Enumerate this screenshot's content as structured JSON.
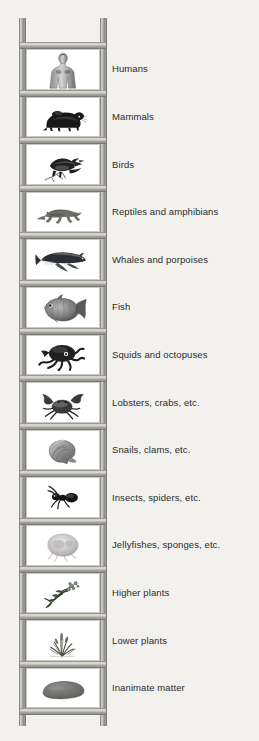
{
  "diagram": {
    "type": "ladder-hierarchy",
    "background_color": "#f2f1ee",
    "rail_color": "#a9a7a2",
    "panel_color": "#ffffff",
    "text_color": "#2b2b2b",
    "rung_count": 15,
    "step_count": 14,
    "rungs": [
      {
        "index": 1,
        "label": "Humans",
        "icon": "human-torso-icon"
      },
      {
        "index": 2,
        "label": "Mammals",
        "icon": "rodent-icon"
      },
      {
        "index": 3,
        "label": "Birds",
        "icon": "bird-on-branch-icon"
      },
      {
        "index": 4,
        "label": "Reptiles and amphibians",
        "icon": "lizard-icon"
      },
      {
        "index": 5,
        "label": "Whales and porpoises",
        "icon": "whale-icon"
      },
      {
        "index": 6,
        "label": "Fish",
        "icon": "fish-icon"
      },
      {
        "index": 7,
        "label": "Squids and octopuses",
        "icon": "octopus-icon"
      },
      {
        "index": 8,
        "label": "Lobsters, crabs, etc.",
        "icon": "crab-icon"
      },
      {
        "index": 9,
        "label": "Snails, clams, etc.",
        "icon": "snail-shell-icon"
      },
      {
        "index": 10,
        "label": "Insects, spiders, etc.",
        "icon": "ant-icon"
      },
      {
        "index": 11,
        "label": "Jellyfishes, sponges, etc.",
        "icon": "jellyfish-icon"
      },
      {
        "index": 12,
        "label": "Higher plants",
        "icon": "flowering-plant-icon"
      },
      {
        "index": 13,
        "label": "Lower plants",
        "icon": "moss-grass-icon"
      },
      {
        "index": 14,
        "label": "Inanimate matter",
        "icon": "rock-icon"
      }
    ]
  }
}
